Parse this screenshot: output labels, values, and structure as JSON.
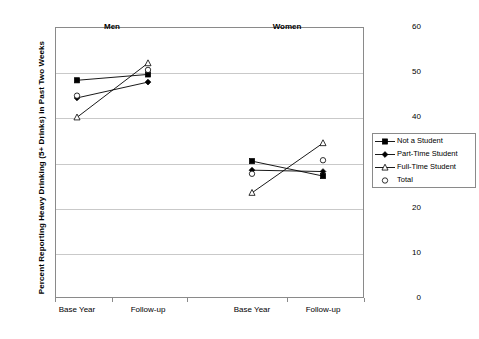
{
  "chart_data": {
    "type": "line",
    "title": "",
    "xlabel": "",
    "ylabel": "Percent Reporting Heavy Drinking (5+ Drinks) in Past Two Weeks",
    "ylim": [
      0,
      60
    ],
    "ytick_step": 10,
    "yticks": [
      0,
      10,
      20,
      30,
      40,
      50,
      60
    ],
    "ytick_labels": [
      "0",
      "10",
      "20",
      "30",
      "40",
      "50",
      "60"
    ],
    "grid": true,
    "legend_position": "right",
    "panels": [
      {
        "label": "Men"
      },
      {
        "label": "Women"
      }
    ],
    "categories": [
      "Base Year",
      "Follow-up",
      "Base Year",
      "Follow-up"
    ],
    "x_tick_labels": [
      "Base Year",
      "Follow-up",
      "Base Year",
      "Follow-up"
    ],
    "series": [
      {
        "name": "Not a Student",
        "marker": "filled-square",
        "line": true,
        "color": "#000000",
        "values": [
          48.2,
          49.5,
          30.3,
          27.0
        ]
      },
      {
        "name": "Part-Time Student",
        "marker": "filled-diamond",
        "line": true,
        "color": "#000000",
        "values": [
          44.3,
          47.8,
          28.3,
          28.0
        ]
      },
      {
        "name": "Full-Time Student",
        "marker": "open-triangle",
        "line": true,
        "color": "#000000",
        "values": [
          40.0,
          52.0,
          23.3,
          34.3
        ]
      },
      {
        "name": "Total",
        "marker": "open-circle",
        "line": false,
        "color": "#000000",
        "values": [
          44.8,
          50.5,
          27.5,
          30.5
        ]
      }
    ]
  },
  "legend": {
    "items": [
      {
        "label": "Not a Student",
        "marker": "filled-square"
      },
      {
        "label": "Part-Time Student",
        "marker": "filled-diamond"
      },
      {
        "label": "Full-Time Student",
        "marker": "open-triangle"
      },
      {
        "label": "Total",
        "marker": "open-circle"
      }
    ]
  },
  "axis": {
    "y_title": "Percent Reporting Heavy Drinking (5+ Drinks) in Past Two Weeks"
  },
  "colors": {
    "ink": "#000000",
    "frame": "#8a8a8a",
    "grid": "#c9c9c9",
    "background": "#ffffff"
  }
}
